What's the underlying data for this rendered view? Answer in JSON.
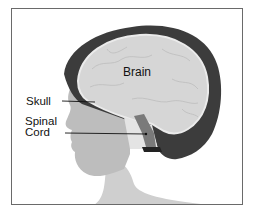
{
  "figure": {
    "type": "anatomical-diagram",
    "labels": {
      "brain": "Brain",
      "skull": "Skull",
      "spinal_line1": "Spinal",
      "spinal_line2": "Cord"
    },
    "colors": {
      "brain_fill": "#d6d6d6",
      "hair": "#3c3c3c",
      "skin": "#c4c4c4",
      "spinal_cord": "#7a7a7a",
      "frame": "#6a6a6a",
      "leader_line": "#111111"
    }
  }
}
